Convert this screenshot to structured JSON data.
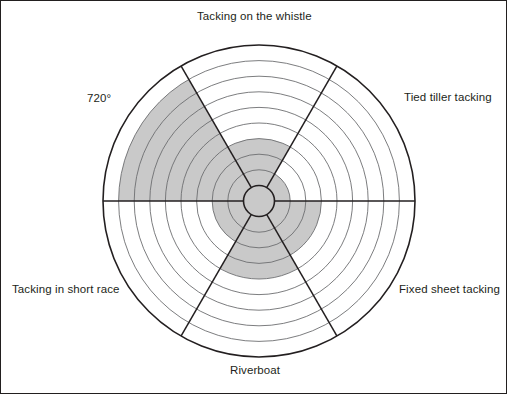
{
  "figure": {
    "background_color": "#ffffff",
    "frame_color": "#221f1f",
    "canvas_width": 507,
    "canvas_height": 394
  },
  "chart_data": {
    "type": "radar",
    "title": "",
    "subtitle": "",
    "xlabel": "",
    "ylabel": "",
    "grid": true,
    "legend_position": "none",
    "fill_color": "#c9c9c9",
    "line_color": "#231f20",
    "grid_color": "#6d6e70",
    "hub_fill_color": "#c9c9c9",
    "rings": 10,
    "ring_labels": [
      "1",
      "2",
      "3",
      "4",
      "5",
      "6",
      "7",
      "8",
      "9",
      "10"
    ],
    "rlim": [
      0,
      10
    ],
    "hub_radius_value": 1,
    "categories": [
      "Tacking on the whistle",
      "Tied tiller tacking",
      "Fixed sheet tacking",
      "Riverboat",
      "Tacking in short race",
      "720°"
    ],
    "values": [
      4,
      2,
      4,
      5,
      3,
      9
    ],
    "series": [
      {
        "name": "Skill rating",
        "values": [
          4,
          2,
          4,
          5,
          3,
          9
        ]
      }
    ],
    "sector_angles_deg": [
      90,
      30,
      330,
      270,
      210,
      150
    ],
    "annotations": []
  },
  "labels": {
    "top": "Tacking on the whistle",
    "upper_right": "Tied tiller tacking",
    "lower_right": "Fixed sheet tacking",
    "bottom": "Riverboat",
    "lower_left": "Tacking in short race",
    "upper_left": "720°"
  }
}
